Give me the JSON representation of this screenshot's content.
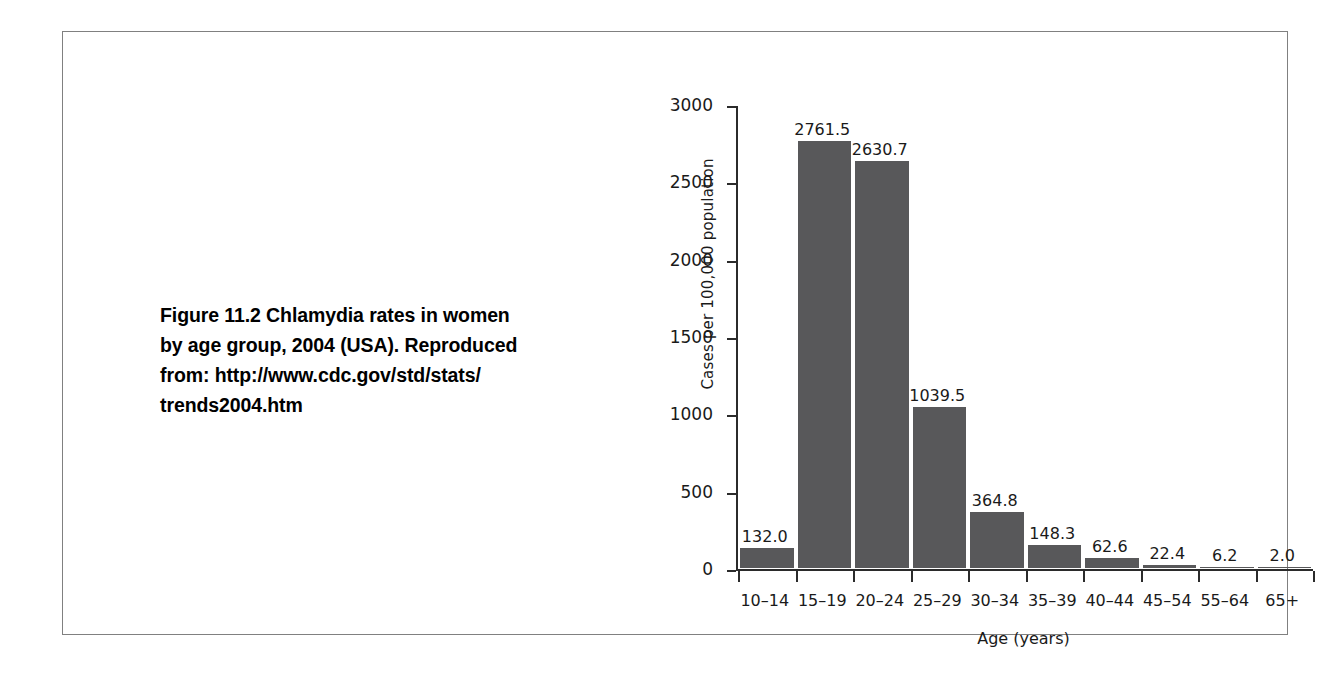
{
  "figure": {
    "caption_line1": "Figure 11.2  Chlamydia rates in women",
    "caption_line2": "by age group, 2004 (USA). Reproduced",
    "caption_line3": "from: http://www.cdc.gov/std/stats/",
    "caption_line4": "trends2004.htm"
  },
  "colors": {
    "bar": "#58585a",
    "axis": "#2b2b2b",
    "frame": "#808080",
    "background": "#ffffff"
  },
  "chart_data": {
    "type": "bar",
    "title": "",
    "xlabel": "Age (years)",
    "ylabel": "Cases per 100,000 population",
    "categories": [
      "10–14",
      "15–19",
      "20–24",
      "25–29",
      "30–34",
      "35–39",
      "40–44",
      "45–54",
      "55–64",
      "65+"
    ],
    "values": [
      132.0,
      2761.5,
      2630.7,
      1039.5,
      364.8,
      148.3,
      62.6,
      22.4,
      6.2,
      2.0
    ],
    "value_labels": [
      "132.0",
      "2761.5",
      "2630.7",
      "1039.5",
      "364.8",
      "148.3",
      "62.6",
      "22.4",
      "6.2",
      "2.0"
    ],
    "ylim": [
      0,
      3000
    ],
    "yticks": [
      0,
      500,
      1000,
      1500,
      2000,
      2500,
      3000
    ],
    "ytick_labels": [
      "0",
      "500",
      "1000",
      "1500",
      "2000",
      "2500",
      "3000"
    ],
    "grid": false,
    "legend": false
  }
}
